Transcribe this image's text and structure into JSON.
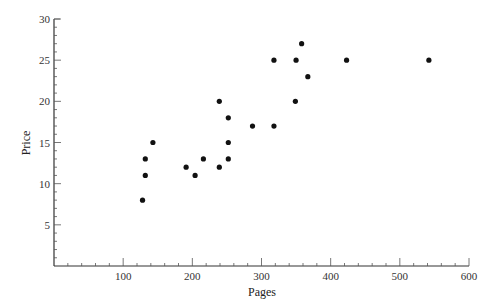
{
  "chart_data": {
    "type": "scatter",
    "title": "",
    "xlabel": "Pages",
    "ylabel": "Price",
    "xlim": [
      0,
      600
    ],
    "ylim": [
      0,
      30
    ],
    "x_ticks": [
      100,
      200,
      300,
      400,
      500,
      600
    ],
    "x_tick_labels": [
      "100",
      "200",
      "300",
      "400",
      "500",
      "600"
    ],
    "y_ticks": [
      5,
      10,
      15,
      20,
      25,
      30
    ],
    "y_tick_labels": [
      "5",
      "10",
      "15",
      "20",
      "25",
      "30"
    ],
    "x_minor_step": 20,
    "y_minor_step": 1,
    "grid": false,
    "legend": null,
    "marker_color": "#111111",
    "points": [
      {
        "x": 128,
        "y": 8
      },
      {
        "x": 132,
        "y": 11
      },
      {
        "x": 132,
        "y": 13
      },
      {
        "x": 143,
        "y": 15
      },
      {
        "x": 191,
        "y": 12
      },
      {
        "x": 204,
        "y": 11
      },
      {
        "x": 216,
        "y": 13
      },
      {
        "x": 239,
        "y": 12
      },
      {
        "x": 239,
        "y": 20
      },
      {
        "x": 252,
        "y": 13
      },
      {
        "x": 252,
        "y": 15
      },
      {
        "x": 252,
        "y": 18
      },
      {
        "x": 287,
        "y": 17
      },
      {
        "x": 318,
        "y": 17
      },
      {
        "x": 318,
        "y": 25
      },
      {
        "x": 349,
        "y": 20
      },
      {
        "x": 350,
        "y": 25
      },
      {
        "x": 358,
        "y": 27
      },
      {
        "x": 367,
        "y": 23
      },
      {
        "x": 423,
        "y": 25
      },
      {
        "x": 542,
        "y": 25
      }
    ]
  }
}
